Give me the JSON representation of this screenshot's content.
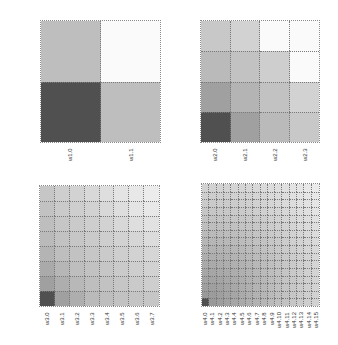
{
  "chart_data": [
    {
      "type": "heatmap",
      "title": "",
      "xlabel": "",
      "ylabel": "",
      "x_ticks": [
        "w1.0",
        "w1.1"
      ],
      "y_ticks": [
        "w1.0",
        "w1.1"
      ],
      "grid": true,
      "colormap": "grayscale (dark = high)",
      "values_rows_bottom_to_top": [
        [
          0.85,
          0.3
        ],
        [
          0.3,
          0.0
        ]
      ]
    },
    {
      "type": "heatmap",
      "title": "",
      "x_ticks": [
        "w2.0",
        "w2.1",
        "w2.2",
        "w2.3"
      ],
      "y_ticks": [
        "w2.0",
        "w2.1",
        "w2.2",
        "w2.3"
      ],
      "grid": true,
      "colormap": "grayscale (dark = high)",
      "values_rows_bottom_to_top": [
        [
          0.85,
          0.45,
          0.32,
          0.25
        ],
        [
          0.45,
          0.35,
          0.28,
          0.2
        ],
        [
          0.32,
          0.28,
          0.22,
          0.0
        ],
        [
          0.25,
          0.2,
          0.0,
          0.0
        ]
      ]
    },
    {
      "type": "heatmap",
      "title": "",
      "x_ticks": [
        "w3.0",
        "w3.1",
        "w3.2",
        "w3.3",
        "w3.4",
        "w3.5",
        "w3.6",
        "w3.7"
      ],
      "y_ticks": [
        "w3.0",
        "w3.1",
        "w3.2",
        "w3.3",
        "w3.4",
        "w3.5",
        "w3.6",
        "w3.7"
      ],
      "grid": true,
      "colormap": "grayscale (dark = high)",
      "values_rows_bottom_to_top": [
        [
          0.85,
          0.45,
          0.38,
          0.32,
          0.3,
          0.28,
          0.27,
          0.26
        ],
        [
          0.45,
          0.38,
          0.33,
          0.3,
          0.28,
          0.26,
          0.24,
          0.22
        ],
        [
          0.4,
          0.34,
          0.3,
          0.28,
          0.26,
          0.24,
          0.22,
          0.2
        ],
        [
          0.35,
          0.3,
          0.28,
          0.26,
          0.24,
          0.22,
          0.2,
          0.18
        ],
        [
          0.32,
          0.28,
          0.26,
          0.24,
          0.22,
          0.2,
          0.18,
          0.15
        ],
        [
          0.3,
          0.26,
          0.24,
          0.22,
          0.2,
          0.17,
          0.14,
          0.12
        ],
        [
          0.28,
          0.24,
          0.22,
          0.2,
          0.17,
          0.14,
          0.11,
          0.09
        ],
        [
          0.26,
          0.22,
          0.2,
          0.17,
          0.14,
          0.11,
          0.09,
          0.07
        ]
      ]
    },
    {
      "type": "heatmap",
      "title": "",
      "x_ticks": [
        "w4.0",
        "w4.1",
        "w4.2",
        "w4.3",
        "w4.4",
        "w4.5",
        "w4.6",
        "w4.7",
        "w4.8",
        "w4.9",
        "w4.10",
        "w4.11",
        "w4.12",
        "w4.13",
        "w4.14",
        "w4.15"
      ],
      "y_ticks": [
        "w4.0",
        "w4.1",
        "w4.2",
        "w4.3",
        "w4.4",
        "w4.5",
        "w4.6",
        "w4.7",
        "w4.8",
        "w4.9",
        "w4.10",
        "w4.11",
        "w4.12",
        "w4.13",
        "w4.14",
        "w4.15"
      ],
      "grid": true,
      "colormap": "grayscale (dark = high)",
      "values_description": "dark at (w4.0,w4.0) ≈0.85, decaying smoothly toward light (~0.08) at top-right"
    }
  ],
  "panels": [
    {
      "x_ticks": [
        "w1.0",
        "w1.1"
      ],
      "y_ticks": [
        "w1.0",
        "w1.1"
      ]
    },
    {
      "x_ticks": [
        "w2.0",
        "w2.1",
        "w2.2",
        "w2.3"
      ],
      "y_ticks": [
        "w2.0",
        "w2.1",
        "w2.2",
        "w2.3"
      ]
    },
    {
      "x_ticks": [
        "w3.0",
        "w3.1",
        "w3.2",
        "w3.3",
        "w3.4",
        "w3.5",
        "w3.6",
        "w3.7"
      ],
      "y_ticks": [
        "w3.0",
        "w3.1",
        "w3.2",
        "w3.3",
        "w3.4",
        "w3.5",
        "w3.6",
        "w3.7"
      ]
    },
    {
      "x_ticks": [
        "w4.0",
        "w4.1",
        "w4.2",
        "w4.3",
        "w4.4",
        "w4.5",
        "w4.6",
        "w4.7",
        "w4.8",
        "w4.9",
        "w4.10",
        "w4.11",
        "w4.12",
        "w4.13",
        "w4.14",
        "w4.15"
      ],
      "y_ticks": [
        "w4.0",
        "w4.1",
        "w4.2",
        "w4.3",
        "w4.4",
        "w4.5",
        "w4.6",
        "w4.7",
        "w4.8",
        "w4.9",
        "w4.10",
        "w4.11",
        "w4.12",
        "w4.13",
        "w4.14",
        "w4.15"
      ]
    }
  ]
}
